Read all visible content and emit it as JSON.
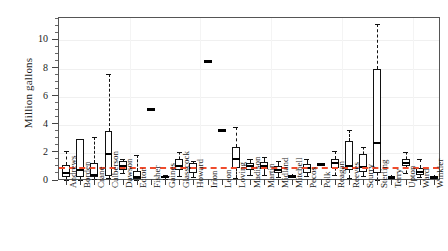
{
  "chart_data": {
    "type": "box",
    "title": "",
    "xlabel": "",
    "ylabel": "Million gallons",
    "ylim": [
      0,
      11.6
    ],
    "yticks": [
      0,
      2,
      4,
      6,
      8,
      10
    ],
    "ytick_labels": [
      "0",
      "2",
      "4",
      "6",
      "8",
      "10"
    ],
    "yminor_step": 0.5,
    "grid": true,
    "legend": "none",
    "reference_line": {
      "value": 1.0,
      "color": "#ef4b2c",
      "style": "dashed",
      "label": ""
    },
    "categories": [
      "Andrews",
      "Borden",
      "Crane",
      "Culberson",
      "Dawson",
      "Ector",
      "Fisher",
      "Gaines",
      "Glasscock",
      "Howard",
      "Irion",
      "Leon",
      "Loving",
      "Madison",
      "Martin",
      "Midland",
      "Mitchell",
      "Pecos",
      "Polk",
      "Reagan",
      "Reeves",
      "Scurry",
      "Sterling",
      "Terry",
      "Upton",
      "Ward",
      "Winkler"
    ],
    "boxes": [
      {
        "category": "Andrews",
        "whisker_low": 0.05,
        "q1": 0.25,
        "median": 0.55,
        "q3": 1.15,
        "whisker_high": 2.1,
        "collapsed": false
      },
      {
        "category": "Borden",
        "whisker_low": 0.1,
        "q1": 0.25,
        "median": 0.8,
        "q3": 3.0,
        "whisker_high": 3.0,
        "collapsed": false
      },
      {
        "category": "Crane",
        "whisker_low": 0.15,
        "q1": 0.3,
        "median": 0.4,
        "q3": 1.3,
        "whisker_high": 3.1,
        "collapsed": false
      },
      {
        "category": "Culberson",
        "whisker_low": 0.2,
        "q1": 0.35,
        "median": 1.95,
        "q3": 3.55,
        "whisker_high": 7.6,
        "collapsed": false
      },
      {
        "category": "Dawson",
        "whisker_low": 0.55,
        "q1": 0.8,
        "median": 1.05,
        "q3": 1.4,
        "whisker_high": 1.6,
        "collapsed": false
      },
      {
        "category": "Ector",
        "whisker_low": 0.05,
        "q1": 0.15,
        "median": 0.25,
        "q3": 0.7,
        "whisker_high": 1.85,
        "collapsed": false
      },
      {
        "category": "Fisher",
        "whisker_low": 5.1,
        "q1": 5.1,
        "median": 5.1,
        "q3": 5.1,
        "whisker_high": 5.1,
        "collapsed": true
      },
      {
        "category": "Gaines",
        "whisker_low": 0.15,
        "q1": 0.2,
        "median": 0.28,
        "q3": 0.35,
        "whisker_high": 0.45,
        "collapsed": false
      },
      {
        "category": "Glasscock",
        "whisker_low": 0.35,
        "q1": 0.8,
        "median": 1.1,
        "q3": 1.55,
        "whisker_high": 2.05,
        "collapsed": false
      },
      {
        "category": "Howard",
        "whisker_low": 0.3,
        "q1": 0.55,
        "median": 0.95,
        "q3": 1.25,
        "whisker_high": 1.4,
        "collapsed": false
      },
      {
        "category": "Irion",
        "whisker_low": 8.5,
        "q1": 8.5,
        "median": 8.5,
        "q3": 8.5,
        "whisker_high": 8.5,
        "collapsed": true
      },
      {
        "category": "Leon",
        "whisker_low": 3.6,
        "q1": 3.6,
        "median": 3.6,
        "q3": 3.6,
        "whisker_high": 3.6,
        "collapsed": true
      },
      {
        "category": "Loving",
        "whisker_low": 0.2,
        "q1": 0.9,
        "median": 1.55,
        "q3": 2.45,
        "whisker_high": 3.85,
        "collapsed": false
      },
      {
        "category": "Madison",
        "whisker_low": 0.45,
        "q1": 0.8,
        "median": 1.05,
        "q3": 1.3,
        "whisker_high": 1.55,
        "collapsed": false
      },
      {
        "category": "Martin",
        "whisker_low": 0.4,
        "q1": 0.85,
        "median": 1.1,
        "q3": 1.35,
        "whisker_high": 1.7,
        "collapsed": false
      },
      {
        "category": "Midland",
        "whisker_low": 0.3,
        "q1": 0.6,
        "median": 0.8,
        "q3": 1.05,
        "whisker_high": 1.45,
        "collapsed": false
      },
      {
        "category": "Mitchell",
        "whisker_low": 0.2,
        "q1": 0.25,
        "median": 0.32,
        "q3": 0.4,
        "whisker_high": 0.5,
        "collapsed": true
      },
      {
        "category": "Pecos",
        "whisker_low": 0.35,
        "q1": 0.6,
        "median": 0.95,
        "q3": 1.2,
        "whisker_high": 1.55,
        "collapsed": false
      },
      {
        "category": "Polk",
        "whisker_low": 1.15,
        "q1": 1.15,
        "median": 1.15,
        "q3": 1.15,
        "whisker_high": 1.15,
        "collapsed": true
      },
      {
        "category": "Reagan",
        "whisker_low": 0.45,
        "q1": 0.9,
        "median": 1.25,
        "q3": 1.6,
        "whisker_high": 2.1,
        "collapsed": false
      },
      {
        "category": "Reeves",
        "whisker_low": 0.2,
        "q1": 0.75,
        "median": 1.05,
        "q3": 2.85,
        "whisker_high": 3.65,
        "collapsed": false
      },
      {
        "category": "Scurry",
        "whisker_low": 0.35,
        "q1": 0.65,
        "median": 1.0,
        "q3": 1.95,
        "whisker_high": 2.45,
        "collapsed": false
      },
      {
        "category": "Sterling",
        "whisker_low": 0.1,
        "q1": 0.6,
        "median": 2.7,
        "q3": 8.0,
        "whisker_high": 11.2,
        "collapsed": false
      },
      {
        "category": "Terry",
        "whisker_low": 0.1,
        "q1": 0.15,
        "median": 0.22,
        "q3": 0.3,
        "whisker_high": 0.4,
        "collapsed": true
      },
      {
        "category": "Upton",
        "whisker_low": 0.6,
        "q1": 1.05,
        "median": 1.3,
        "q3": 1.55,
        "whisker_high": 2.05,
        "collapsed": false
      },
      {
        "category": "Ward",
        "whisker_low": 0.25,
        "q1": 0.45,
        "median": 0.65,
        "q3": 0.9,
        "whisker_high": 1.6,
        "collapsed": false
      },
      {
        "category": "Winkler",
        "whisker_low": 0.1,
        "q1": 0.15,
        "median": 0.25,
        "q3": 0.35,
        "whisker_high": 0.45,
        "collapsed": true
      }
    ]
  }
}
